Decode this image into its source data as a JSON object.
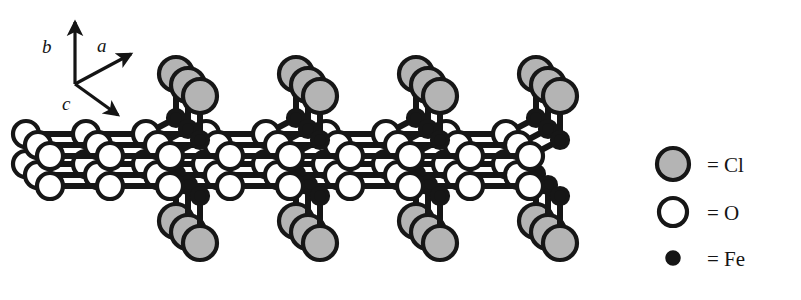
{
  "figure": {
    "kind": "crystal-structure-diagram",
    "compound": "FeOCl",
    "background_color": "#ffffff",
    "line_color": "#161616",
    "repeat_units": 4
  },
  "axes": {
    "name": "crystallographic-axis-indicator",
    "origin": {
      "x": 75,
      "y": 84
    },
    "items": [
      {
        "id": "b",
        "label": "b",
        "tip": {
          "x": 75,
          "y": 22
        },
        "label_pos": {
          "x": 42,
          "y": 53
        }
      },
      {
        "id": "a",
        "label": "a",
        "tip": {
          "x": 131,
          "y": 54
        },
        "label_pos": {
          "x": 97,
          "y": 52
        }
      },
      {
        "id": "c",
        "label": "c",
        "tip": {
          "x": 118,
          "y": 115
        },
        "label_pos": {
          "x": 62,
          "y": 110
        }
      }
    ]
  },
  "legend": {
    "name": "species-legend",
    "entries": [
      {
        "id": "cl",
        "symbol": "Cl",
        "text": "= Cl",
        "style": "filled-gray-circle",
        "fill": "#b4b4b4",
        "stroke": "#161616",
        "marker": {
          "cx": 673,
          "cy": 164,
          "r": 16
        },
        "label_pos": {
          "x": 707,
          "y": 172
        }
      },
      {
        "id": "o",
        "symbol": "O",
        "text": "= O",
        "style": "open-white-circle",
        "fill": "#ffffff",
        "stroke": "#161616",
        "marker": {
          "cx": 673,
          "cy": 212,
          "r": 14
        },
        "label_pos": {
          "x": 707,
          "y": 220
        }
      },
      {
        "id": "fe",
        "symbol": "Fe",
        "text": "= Fe",
        "style": "filled-black-dot",
        "fill": "#161616",
        "stroke": "#161616",
        "marker": {
          "cx": 673,
          "cy": 258,
          "r": 7
        },
        "label_pos": {
          "x": 707,
          "y": 266
        }
      }
    ]
  },
  "structure": {
    "name": "feocl-slab",
    "geometry": {
      "unit_spacing_x": 120,
      "first_unit_x": 200,
      "depth_step": {
        "dx": -12,
        "dy": -11
      },
      "depth_layers": 3,
      "cl_radius": 17,
      "o_radius": 13,
      "fe_radius": 8,
      "bond_width": 6,
      "cl_top_y": 96,
      "cl_bottom_y": 243,
      "fe_top_y": 140,
      "fe_bottom_y": 196,
      "o_upper_y": 156,
      "o_lower_y": 186
    },
    "colors": {
      "cl_fill": "#b4b4b4",
      "o_fill": "#ffffff",
      "fe_fill": "#161616",
      "outline": "#161616"
    },
    "counts": {
      "cl_clusters_top": 4,
      "cl_clusters_bottom": 4,
      "atoms_per_cluster": 3,
      "o_columns": 9,
      "o_rows": 2
    }
  }
}
